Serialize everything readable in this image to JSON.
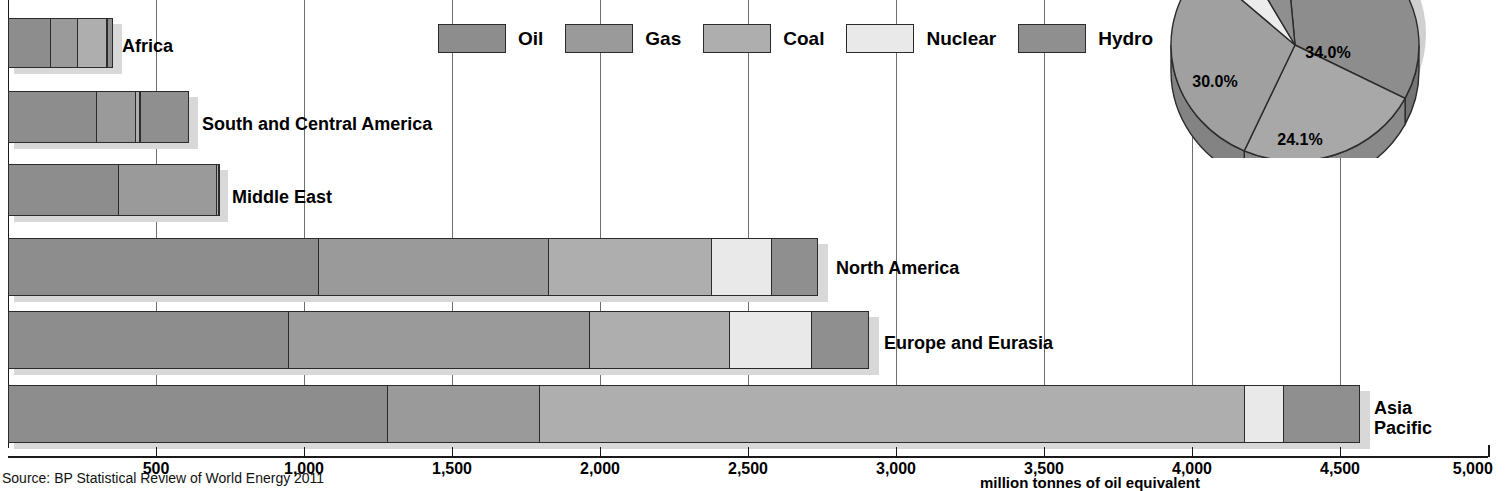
{
  "chart_data": {
    "type": "bar",
    "title": "",
    "subtitle": "",
    "orientation": "horizontal",
    "stacked": true,
    "xlabel": "million tonnes of oil equivalent",
    "ylabel": "",
    "xlim": [
      0,
      5000
    ],
    "xticks": [
      500,
      1000,
      1500,
      2000,
      2500,
      3000,
      3500,
      4000,
      4500,
      5000
    ],
    "xtick_labels": [
      "500",
      "1,000",
      "1,500",
      "2,000",
      "2,500",
      "3,000",
      "3,500",
      "4,000",
      "4,500",
      "5,000"
    ],
    "grid": true,
    "legend_position": "top-center",
    "categories": [
      "Africa",
      "South and Central America",
      "Middle East",
      "North America",
      "Europe and Eurasia",
      "Asia Pacific"
    ],
    "series": [
      {
        "name": "Oil",
        "color": "#8d8d8d",
        "values": [
          145,
          300,
          375,
          1050,
          950,
          1285
        ]
      },
      {
        "name": "Gas",
        "color": "#9a9a9a",
        "values": [
          95,
          135,
          335,
          780,
          1020,
          515
        ]
      },
      {
        "name": "Coal",
        "color": "#aeaeae",
        "values": [
          100,
          18,
          10,
          555,
          475,
          2385
        ]
      },
      {
        "name": "Nuclear",
        "color": "#e9e9e9",
        "values": [
          3,
          5,
          0,
          207,
          280,
          135
        ]
      },
      {
        "name": "Hydro",
        "color": "#8f8f8f",
        "values": [
          23,
          165,
          3,
          159,
          196,
          260
        ]
      }
    ],
    "source": "Source: BP Statistical Review of World Energy 2011",
    "pie": {
      "type": "pie",
      "title": "",
      "labels": [
        "Oil",
        "Coal",
        "Gas",
        "Nuclear",
        "Hydro"
      ],
      "values": [
        34.0,
        24.1,
        30.0,
        5.2,
        6.7
      ],
      "value_labels": [
        "34.0%",
        "24.1%",
        "30.0%",
        "",
        ""
      ],
      "colors": [
        "#8d8d8d",
        "#a8a8a8",
        "#a0a0a0",
        "#ececec",
        "#8f8f8f"
      ]
    }
  },
  "legend": {
    "items": [
      {
        "label": "Oil",
        "color": "#8d8d8d"
      },
      {
        "label": "Gas",
        "color": "#9a9a9a"
      },
      {
        "label": "Coal",
        "color": "#aeaeae"
      },
      {
        "label": "Nuclear",
        "color": "#e9e9e9"
      },
      {
        "label": "Hydro",
        "color": "#8f8f8f"
      }
    ]
  },
  "axis": {
    "title": "million tonnes of oil equivalent",
    "ticks": [
      "500",
      "1,000",
      "1,500",
      "2,000",
      "2,500",
      "3,000",
      "3,500",
      "4,000",
      "4,500",
      "5,000"
    ]
  },
  "labels": {
    "africa": "Africa",
    "south_central_america": "South and Central America",
    "middle_east": "Middle East",
    "north_america": "North America",
    "europe_eurasia": "Europe and Eurasia",
    "asia_pacific": "Asia\nPacific"
  },
  "pie_labels": {
    "oil": "34.0%",
    "gas": "30.0%",
    "coal": "24.1%"
  },
  "source": "Source: BP Statistical Review of World Energy 2011"
}
